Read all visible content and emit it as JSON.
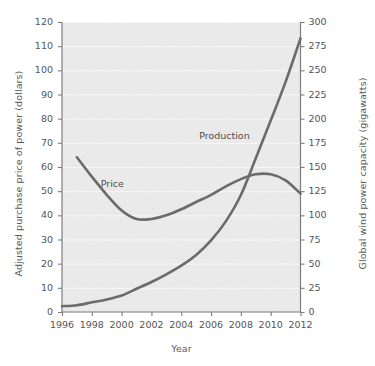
{
  "chart_data": {
    "type": "line",
    "title": "",
    "xlabel": "Year",
    "ylabel": "Adjusted purchase price of power (dollars)",
    "y2label": "Global wind power capacity (gigawatts)",
    "xlim": [
      1996,
      2012
    ],
    "ylim": [
      0,
      120
    ],
    "y2lim": [
      0,
      300
    ],
    "xticks": [
      1996,
      1998,
      2000,
      2002,
      2004,
      2006,
      2008,
      2010,
      2012
    ],
    "xticklabels": [
      "1996",
      "1998",
      "2000",
      "2002",
      "2004",
      "2006",
      "2008",
      "2010",
      "2012"
    ],
    "yticks": [
      0,
      10,
      20,
      30,
      40,
      50,
      60,
      70,
      80,
      90,
      100,
      110,
      120
    ],
    "yticklabels": [
      "0",
      "10",
      "20",
      "30",
      "40",
      "50",
      "60",
      "70",
      "80",
      "90",
      "100",
      "110",
      "120"
    ],
    "y2ticks": [
      0,
      25,
      50,
      75,
      100,
      125,
      150,
      175,
      200,
      225,
      250,
      275,
      300
    ],
    "y2ticklabels": [
      "0",
      "25",
      "50",
      "75",
      "100",
      "125",
      "150",
      "175",
      "200",
      "225",
      "250",
      "275",
      "300"
    ],
    "grid": "horizontal-faint",
    "legend": "inline-annotations",
    "line_color": "#6b6b6b",
    "plot_background": "#ebebeb",
    "gridline_color": "#f7f7f7",
    "axis_color": "#7d7d7d",
    "series": [
      {
        "name": "Price",
        "axis": "left",
        "units": "dollars",
        "label_text": "Price",
        "x": [
          1997,
          1998,
          1999,
          2000,
          2001,
          2002,
          2003,
          2004,
          2005,
          2006,
          2007,
          2008,
          2009,
          2010,
          2011,
          2012
        ],
        "values": [
          64,
          56,
          48.5,
          42,
          38.5,
          38.5,
          40,
          42.5,
          45.5,
          48.5,
          52,
          55,
          57,
          57,
          54.5,
          49
        ]
      },
      {
        "name": "Production",
        "axis": "right",
        "units": "gigawatts",
        "label_text": "Production",
        "x": [
          1996,
          1997,
          1998,
          1999,
          2000,
          2001,
          2002,
          2003,
          2004,
          2005,
          2006,
          2007,
          2008,
          2009,
          2010,
          2011,
          2012
        ],
        "values": [
          6,
          7,
          10,
          13,
          17,
          24,
          31,
          39,
          48,
          59,
          74,
          94,
          121,
          159,
          198,
          238,
          283
        ]
      }
    ],
    "annotations": [
      {
        "text": "Price",
        "x": 1998.6,
        "y_left": 53
      },
      {
        "text": "Production",
        "x": 2005.2,
        "y_left": 73
      }
    ]
  },
  "axes": {
    "left_title": "Adjusted purchase price of power (dollars)",
    "right_title": "Global wind power capacity (gigawatts)",
    "x_title": "Year"
  }
}
